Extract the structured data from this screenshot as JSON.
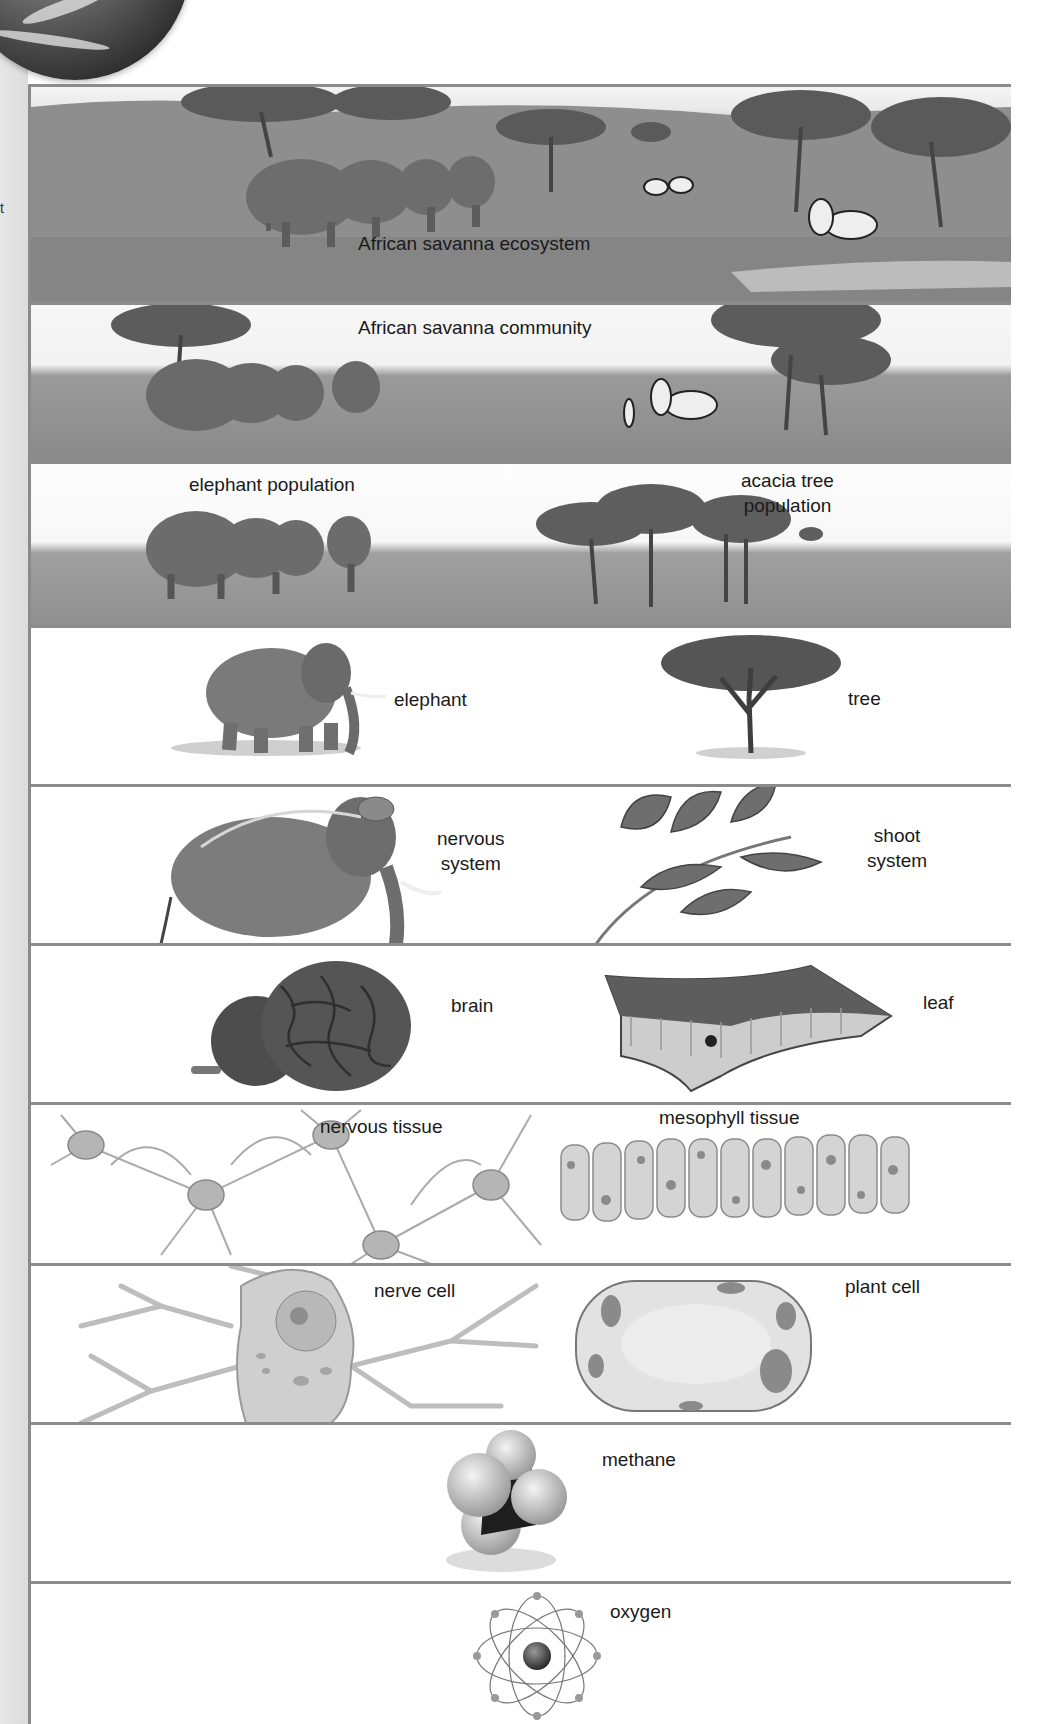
{
  "figure": {
    "left_margin_mark": "t",
    "rows": [
      {
        "level": "ecosystem",
        "labels": [
          "African savanna ecosystem"
        ]
      },
      {
        "level": "community",
        "labels": [
          "African savanna community"
        ]
      },
      {
        "level": "population",
        "labels": [
          "elephant population",
          "acacia tree",
          "population"
        ]
      },
      {
        "level": "organism",
        "labels": [
          "elephant",
          "tree"
        ]
      },
      {
        "level": "organ system",
        "labels": [
          "nervous",
          "system",
          "shoot",
          "system"
        ]
      },
      {
        "level": "organ",
        "labels": [
          "brain",
          "leaf"
        ]
      },
      {
        "level": "tissue",
        "labels": [
          "nervous tissue",
          "mesophyll tissue"
        ]
      },
      {
        "level": "cell",
        "labels": [
          "nerve cell",
          "plant cell"
        ]
      },
      {
        "level": "molecule",
        "labels": [
          "methane"
        ]
      },
      {
        "level": "atom",
        "labels": [
          "oxygen"
        ]
      }
    ]
  },
  "colors": {
    "border": "#8c8c8c",
    "grass": "#8f8f8f",
    "sky": "#f2f2f2",
    "text": "#1a1a1a"
  }
}
